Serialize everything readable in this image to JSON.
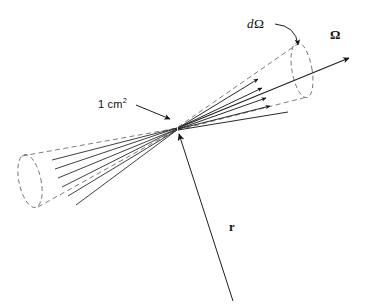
{
  "figure": {
    "domain": "physics-radiometry-diagram",
    "background_color": "#ffffff",
    "ink_color": "#1a1a1a",
    "dashed_color": "#6e6e6e"
  },
  "labels": {
    "solid_angle_element": {
      "d": "d",
      "omega": "Ω",
      "full_text": "dΩ",
      "meaning": "differential element of solid angle"
    },
    "direction_vector": {
      "text": "Ω",
      "meaning": "unit vector giving direction of propagation"
    },
    "area_element": {
      "text": "1 cm",
      "exponent": "2",
      "full_text": "1 cm²",
      "meaning": "unit area element at the vertex"
    },
    "position_vector": {
      "text": "r",
      "meaning": "position vector to the area element"
    }
  },
  "geometry": {
    "vertex": {
      "x": 178,
      "y": 128
    },
    "left_cone": {
      "style": "dashed",
      "cap_center": {
        "x": 30,
        "y": 181
      },
      "cap_rx": 11,
      "cap_ry": 27,
      "cap_rotation_deg": -12,
      "ray_count": 6,
      "ray_style": "solid"
    },
    "right_cone": {
      "style": "dashed",
      "cap_center": {
        "x": 302,
        "y": 70
      },
      "cap_rx": 10,
      "cap_ry": 28,
      "cap_rotation_deg": -10,
      "ray_count": 5,
      "arrowhead_count": 4,
      "ray_style": "solid"
    },
    "omega_axis": {
      "from": {
        "x": 178,
        "y": 128
      },
      "to": {
        "x": 352,
        "y": 57
      },
      "arrowhead": true
    },
    "r_axis": {
      "from": {
        "x": 233,
        "y": 301
      },
      "to": {
        "x": 177,
        "y": 131
      },
      "arrowhead": true
    },
    "domega_leader": {
      "from": {
        "x": 275,
        "y": 24
      },
      "to": {
        "x": 299,
        "y": 48
      },
      "curved": true,
      "arrowhead": true
    },
    "area_leader": {
      "from": {
        "x": 136,
        "y": 105
      },
      "to": {
        "x": 172,
        "y": 120
      },
      "arrowhead": true
    }
  }
}
